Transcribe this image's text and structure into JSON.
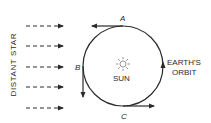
{
  "diagram": {
    "type": "orbital-parallax",
    "star_label": "DISTANT STAR",
    "sun_label": "SUN",
    "orbit_label_line1": "EARTH'S",
    "orbit_label_line2": "ORBIT",
    "points": [
      {
        "id": "A",
        "label": "A",
        "position": "top",
        "direction": "left"
      },
      {
        "id": "B",
        "label": "B",
        "position": "left",
        "direction": "down"
      },
      {
        "id": "C",
        "label": "C",
        "position": "bottom",
        "direction": "right"
      }
    ],
    "starlight_rays": 5,
    "orbit_direction": "counterclockwise",
    "colors": {
      "line": "#2a2a2a",
      "background": "#ffffff"
    }
  }
}
